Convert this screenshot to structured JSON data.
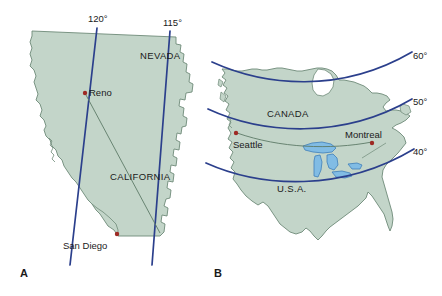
{
  "figure": {
    "background_color": "#ffffff",
    "land_fill": "#c3d5c9",
    "land_stroke": "#6e8a78",
    "grid_line_color": "#2b3f8c",
    "route_line_color": "#5d7a68",
    "city_dot_color": "#9e2a24",
    "lake_fill": "#81bce4",
    "lake_stroke": "#3f7fba"
  },
  "panels": [
    {
      "letter": "A",
      "name": "california-nevada-panel",
      "region_labels": [
        {
          "text": "NEVADA",
          "x": 140,
          "y": 59
        },
        {
          "text": "CALIFORNIA",
          "x": 110,
          "y": 180
        }
      ],
      "grid_labels": [
        {
          "text": "120°",
          "x": 88,
          "y": 22
        },
        {
          "text": "115°",
          "x": 163,
          "y": 26
        }
      ],
      "grid_type": "meridians",
      "cities": [
        {
          "name": "Reno",
          "label_x": 92,
          "label_y": 96,
          "dot_x": 85,
          "dot_y": 93
        },
        {
          "name": "San Diego",
          "label_x": 63,
          "label_y": 249,
          "dot_x": 117,
          "dot_y": 235
        }
      ]
    },
    {
      "letter": "B",
      "name": "north-america-panel",
      "region_labels": [
        {
          "text": "CANADA",
          "x": 267,
          "y": 117
        },
        {
          "text": "U.S.A.",
          "x": 277,
          "y": 192
        }
      ],
      "grid_labels": [
        {
          "text": "60°",
          "x": 413,
          "y": 59
        },
        {
          "text": "50°",
          "x": 413,
          "y": 105
        },
        {
          "text": "40°",
          "x": 413,
          "y": 155
        }
      ],
      "grid_type": "parallels",
      "cities": [
        {
          "name": "Seattle",
          "label_x": 233,
          "label_y": 148,
          "dot_x": 236,
          "dot_y": 133
        },
        {
          "name": "Montreal",
          "label_x": 345,
          "label_y": 138,
          "dot_x": 372,
          "dot_y": 143
        }
      ]
    }
  ],
  "panel_letters": [
    {
      "text": "A",
      "x": 20,
      "y": 277
    },
    {
      "text": "B",
      "x": 214,
      "y": 277
    }
  ]
}
